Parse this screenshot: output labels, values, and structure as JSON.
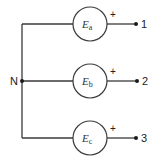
{
  "diagram": {
    "type": "circuit",
    "neutral": {
      "label": "N",
      "x": 22,
      "y": 81
    },
    "colors": {
      "wire": "#3a3a3a",
      "terminal": "#1a1a1a",
      "text": "#222222"
    },
    "sources": [
      {
        "id": "a",
        "symbol": "E",
        "subscript": "a",
        "polarity": "+",
        "terminal": "1",
        "y": 24
      },
      {
        "id": "b",
        "symbol": "E",
        "subscript": "b",
        "polarity": "+",
        "terminal": "2",
        "y": 81
      },
      {
        "id": "c",
        "symbol": "E",
        "subscript": "c",
        "polarity": "+",
        "terminal": "3",
        "y": 138
      }
    ]
  }
}
